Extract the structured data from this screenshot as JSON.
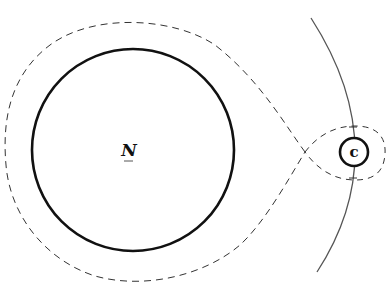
{
  "diagram": {
    "labels": {
      "large_body": "N",
      "small_body": "c"
    },
    "colors": {
      "stroke": "#111111",
      "orbit": "#555555",
      "dashed": "#333333",
      "background": "#ffffff"
    }
  }
}
